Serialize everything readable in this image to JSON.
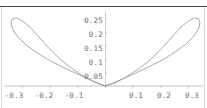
{
  "figure": {
    "background_color": "#ffffff",
    "axis_color": "#b4b4b4",
    "curve_color": "#8c8c8c",
    "label_color": "#6d6d6d",
    "top_rule_color": "#4a4a4a"
  },
  "chart_data": {
    "type": "line",
    "title": "",
    "xlabel": "",
    "ylabel": "",
    "grid": false,
    "legend": null,
    "xlim": [
      -0.36,
      0.36
    ],
    "ylim": [
      0,
      0.275
    ],
    "x_ticks": [
      -0.3,
      -0.2,
      -0.1,
      0.1,
      0.2,
      0.3
    ],
    "x_tick_labels": [
      "-0.3",
      "-0.2",
      "-0.1",
      "0.1",
      "0.2",
      "0.3"
    ],
    "y_ticks": [
      0.05,
      0.1,
      0.15,
      0.2,
      0.25
    ],
    "y_tick_labels": [
      "0.05",
      "0.1",
      "0.15",
      "0.2",
      "0.25"
    ],
    "series": [
      {
        "name": "left-lobe",
        "points": [
          [
            0.0,
            0.0
          ],
          [
            -0.035,
            0.012
          ],
          [
            -0.075,
            0.034
          ],
          [
            -0.12,
            0.064
          ],
          [
            -0.165,
            0.101
          ],
          [
            -0.205,
            0.142
          ],
          [
            -0.24,
            0.183
          ],
          [
            -0.272,
            0.219
          ],
          [
            -0.3,
            0.243
          ],
          [
            -0.322,
            0.254
          ],
          [
            -0.336,
            0.251
          ],
          [
            -0.341,
            0.236
          ],
          [
            -0.336,
            0.213
          ],
          [
            -0.318,
            0.185
          ],
          [
            -0.29,
            0.156
          ],
          [
            -0.252,
            0.127
          ],
          [
            -0.208,
            0.099
          ],
          [
            -0.16,
            0.073
          ],
          [
            -0.112,
            0.05
          ],
          [
            -0.068,
            0.029
          ],
          [
            -0.03,
            0.012
          ],
          [
            0.0,
            0.0
          ]
        ]
      },
      {
        "name": "right-lobe",
        "points": [
          [
            0.0,
            0.0
          ],
          [
            0.035,
            0.012
          ],
          [
            0.075,
            0.034
          ],
          [
            0.12,
            0.064
          ],
          [
            0.165,
            0.101
          ],
          [
            0.205,
            0.142
          ],
          [
            0.24,
            0.183
          ],
          [
            0.272,
            0.219
          ],
          [
            0.3,
            0.243
          ],
          [
            0.322,
            0.254
          ],
          [
            0.336,
            0.251
          ],
          [
            0.341,
            0.236
          ],
          [
            0.336,
            0.213
          ],
          [
            0.318,
            0.185
          ],
          [
            0.29,
            0.156
          ],
          [
            0.252,
            0.127
          ],
          [
            0.208,
            0.099
          ],
          [
            0.16,
            0.073
          ],
          [
            0.112,
            0.05
          ],
          [
            0.068,
            0.029
          ],
          [
            0.03,
            0.012
          ],
          [
            0.0,
            0.0
          ]
        ]
      }
    ]
  },
  "y_labels": [
    {
      "text": "0.25",
      "top": 17
    },
    {
      "text": "0.2",
      "top": 31
    },
    {
      "text": "0.15",
      "top": 45
    },
    {
      "text": "0.1",
      "top": 59
    },
    {
      "text": "0.05",
      "top": 73
    }
  ],
  "x_labels": [
    {
      "text": "-0.3",
      "left": 14
    },
    {
      "text": "-0.2",
      "left": 44
    },
    {
      "text": "-0.1",
      "left": 74
    },
    {
      "text": "0.1",
      "left": 136
    },
    {
      "text": "0.2",
      "left": 164
    },
    {
      "text": "0.3",
      "left": 192
    }
  ]
}
